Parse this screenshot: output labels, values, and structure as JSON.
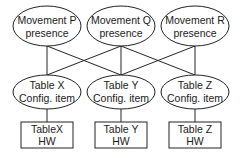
{
  "diagram": {
    "type": "layered-graph",
    "top_nodes": [
      {
        "id": "P",
        "line1": "Movement P",
        "line2": "presence"
      },
      {
        "id": "Q",
        "line1": "Movement Q",
        "line2": "presence"
      },
      {
        "id": "R",
        "line1": "Movement R",
        "line2": "presence"
      }
    ],
    "middle_nodes": [
      {
        "id": "X",
        "line1": "Table X",
        "line2": "Config. item"
      },
      {
        "id": "Y",
        "line1": "Table Y",
        "line2": "Config. item"
      },
      {
        "id": "Z",
        "line1": "Table Z",
        "line2": "Config. item"
      }
    ],
    "bottom_nodes": [
      {
        "id": "XHW",
        "line1": "TableX",
        "line2": "HW"
      },
      {
        "id": "YHW",
        "line1": "Table Y",
        "line2": "HW"
      },
      {
        "id": "ZHW",
        "line1": "Table Z",
        "line2": "HW"
      }
    ],
    "edges": [
      [
        "P",
        "X"
      ],
      [
        "P",
        "Y"
      ],
      [
        "Q",
        "X"
      ],
      [
        "Q",
        "Y"
      ],
      [
        "Q",
        "Z"
      ],
      [
        "R",
        "Y"
      ],
      [
        "R",
        "Z"
      ],
      [
        "X",
        "XHW"
      ],
      [
        "Y",
        "YHW"
      ],
      [
        "Z",
        "ZHW"
      ]
    ]
  }
}
